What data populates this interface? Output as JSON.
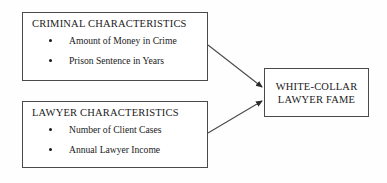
{
  "diagram": {
    "background_color": "#fefefe",
    "line_color": "#4a4a4a",
    "text_color": "#1a1a1a",
    "boxes": [
      {
        "id": "criminal",
        "heading": "CRIMINAL CHARACTERISTICS",
        "items": [
          "Amount of Money in Crime",
          "Prison Sentence in Years"
        ]
      },
      {
        "id": "lawyer",
        "heading": "LAWYER CHARACTERISTICS",
        "items": [
          "Number of Client Cases",
          "Annual Lawyer Income"
        ]
      },
      {
        "id": "outcome",
        "line1": "WHITE-COLLAR",
        "line2": "LAWYER FAME"
      }
    ],
    "arrows": [
      {
        "id": "criminal-to-outcome",
        "from": "criminal",
        "to": "outcome"
      },
      {
        "id": "lawyer-to-outcome",
        "from": "lawyer",
        "to": "outcome"
      }
    ]
  }
}
